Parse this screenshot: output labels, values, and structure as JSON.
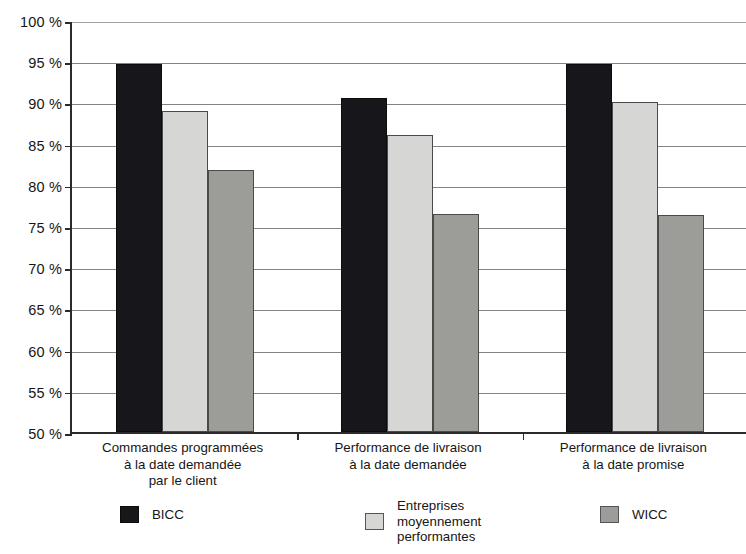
{
  "chart_data": {
    "type": "bar",
    "title": "",
    "subtitle": "",
    "xlabel": "",
    "ylabel": "",
    "ylim": [
      50,
      100
    ],
    "ytick_step": 5,
    "grid": true,
    "legend_position": "bottom",
    "categories": [
      "Commandes programmées\nà la date demandée\npar le client",
      "Performance de livraison\nà la date demandée",
      "Performance de livraison\nà la date promise"
    ],
    "ytick_labels": [
      "100 %",
      "95 %",
      "90 %",
      "85 %",
      "80 %",
      "75 %",
      "70 %",
      "65 %",
      "60 %",
      "55 %",
      "50 %"
    ],
    "ytick_values": [
      100,
      95,
      90,
      85,
      80,
      75,
      70,
      65,
      60,
      55,
      50
    ],
    "series": [
      {
        "name": "BICC",
        "color": "#17161a",
        "values": [
          94.7,
          90.5,
          94.7
        ]
      },
      {
        "name": "Entreprises\nmoyennement\nperformantes",
        "color": "#d6d6d4",
        "values": [
          89.0,
          86.0,
          90.0
        ]
      },
      {
        "name": "WICC",
        "color": "#9c9c99",
        "values": [
          81.8,
          76.5,
          76.3
        ]
      }
    ]
  },
  "legend": {
    "items": [
      {
        "label": "BICC",
        "color": "#17161a"
      },
      {
        "label": "Entreprises\nmoyennement\nperformantes",
        "color": "#d6d6d4"
      },
      {
        "label": "WICC",
        "color": "#9c9c99"
      }
    ]
  },
  "axis": {
    "y_min_label": "50 %",
    "y_max_label": "100 %"
  }
}
